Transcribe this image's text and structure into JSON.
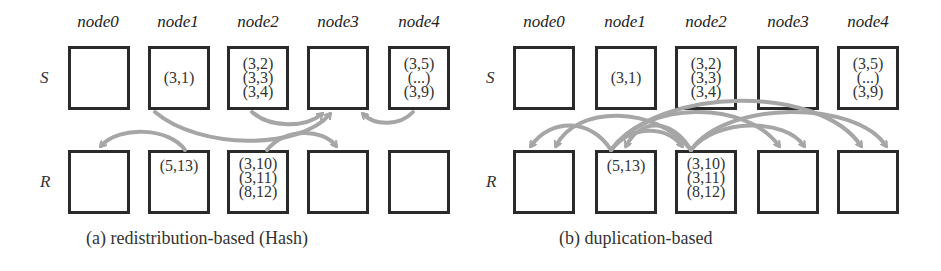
{
  "panels": [
    {
      "id": "a",
      "caption": "(a) redistribution-based (Hash)",
      "nodes": [
        "node0",
        "node1",
        "node2",
        "node3",
        "node4"
      ],
      "rows": [
        {
          "label": "S",
          "cells": [
            [],
            [
              "(3,1)"
            ],
            [
              "(3,2)",
              "(3,3)",
              "(3,4)"
            ],
            [],
            [
              "(3,5)",
              "(...)",
              "(3,9)"
            ]
          ]
        },
        {
          "label": "R",
          "cells": [
            [],
            [
              "(5,13)"
            ],
            [
              "(3,10)",
              "(3,11)",
              "(8,12)"
            ],
            [],
            []
          ]
        }
      ],
      "arrows": [
        {
          "from": "S.node1",
          "to": "S.node3"
        },
        {
          "from": "S.node2",
          "to": "S.node3"
        },
        {
          "from": "S.node4",
          "to": "S.node3"
        },
        {
          "from": "R.node1",
          "to": "R.node0"
        },
        {
          "from": "R.node2",
          "to": "R.node3"
        }
      ]
    },
    {
      "id": "b",
      "caption": "(b) duplication-based",
      "nodes": [
        "node0",
        "node1",
        "node2",
        "node3",
        "node4"
      ],
      "rows": [
        {
          "label": "S",
          "cells": [
            [],
            [
              "(3,1)"
            ],
            [
              "(3,2)",
              "(3,3)",
              "(3,4)"
            ],
            [],
            [
              "(3,5)",
              "(...)",
              "(3,9)"
            ]
          ]
        },
        {
          "label": "R",
          "cells": [
            [],
            [
              "(5,13)"
            ],
            [
              "(3,10)",
              "(3,11)",
              "(8,12)"
            ],
            [],
            []
          ]
        }
      ],
      "arrows": [
        {
          "from": "R.node1",
          "to": "R.node0"
        },
        {
          "from": "R.node1",
          "to": "R.node2"
        },
        {
          "from": "R.node1",
          "to": "R.node3"
        },
        {
          "from": "R.node1",
          "to": "R.node4"
        },
        {
          "from": "R.node2",
          "to": "R.node0"
        },
        {
          "from": "R.node2",
          "to": "R.node1"
        },
        {
          "from": "R.node2",
          "to": "R.node3"
        },
        {
          "from": "R.node2",
          "to": "R.node4"
        }
      ]
    }
  ],
  "colors": {
    "box_border": "#2a2a2a",
    "arrow": "#a6a6a6",
    "text": "#333333"
  }
}
